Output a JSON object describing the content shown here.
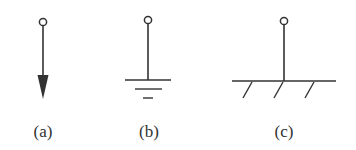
{
  "figure": {
    "type": "symbol-set",
    "stroke_color": "#333333",
    "background": "#ffffff",
    "panels": [
      {
        "id": "a",
        "label": "(a)",
        "symbol": "terminal-with-downward-arrow"
      },
      {
        "id": "b",
        "label": "(b)",
        "symbol": "terminal-with-electrical-ground"
      },
      {
        "id": "c",
        "label": "(c)",
        "symbol": "terminal-with-fixed-support-hatched-ground"
      }
    ]
  }
}
